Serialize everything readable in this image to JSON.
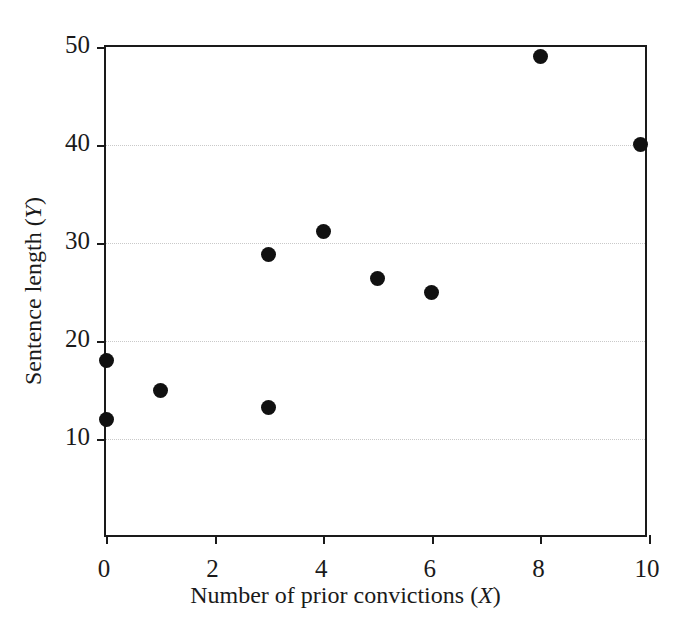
{
  "chart_data": {
    "type": "scatter",
    "title": "",
    "xlabel": "Number of prior convictions (X)",
    "xlabel_parts": {
      "text": "Number of prior convictions (",
      "italic": "X",
      "tail": ")"
    },
    "ylabel": "Sentence length (Y)",
    "ylabel_parts": {
      "text": "Sentence length (",
      "italic": "Y",
      "tail": ")"
    },
    "xlim": [
      0,
      10
    ],
    "ylim": [
      0,
      50
    ],
    "xticks": [
      0,
      2,
      4,
      6,
      8,
      10
    ],
    "xtick_labels": [
      "0",
      "2",
      "4",
      "6",
      "8",
      "10"
    ],
    "yticks": [
      10,
      20,
      30,
      40,
      50
    ],
    "ytick_labels": [
      "10",
      "20",
      "30",
      "40",
      "50"
    ],
    "grid": "horizontal-dotted",
    "legend": null,
    "marker": {
      "shape": "circle",
      "color": "#111111",
      "size_px": 15
    },
    "x": [
      0,
      0,
      1,
      3,
      3,
      4,
      5,
      6,
      8,
      9.85
    ],
    "y": [
      18,
      12,
      15,
      28.8,
      13.2,
      31.2,
      26.4,
      25,
      49,
      40.1
    ],
    "points": [
      {
        "x": 0,
        "y": 18
      },
      {
        "x": 0,
        "y": 12
      },
      {
        "x": 1,
        "y": 15
      },
      {
        "x": 3,
        "y": 28.8
      },
      {
        "x": 3,
        "y": 13.2
      },
      {
        "x": 4,
        "y": 31.2
      },
      {
        "x": 5,
        "y": 26.4
      },
      {
        "x": 6,
        "y": 25
      },
      {
        "x": 8,
        "y": 49
      },
      {
        "x": 9.85,
        "y": 40.1
      }
    ]
  },
  "colors": {
    "marker": "#111111",
    "axis": "#1a1a1a",
    "grid": "#c9c9c9",
    "background": "#ffffff"
  }
}
